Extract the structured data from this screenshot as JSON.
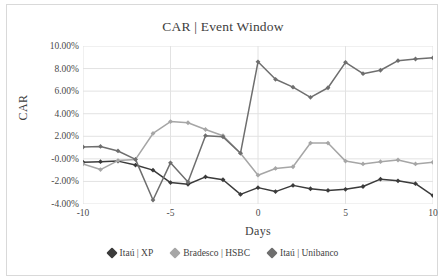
{
  "chart_data": {
    "type": "line",
    "title": "CAR | Event Window",
    "xlabel": "Days",
    "ylabel": "CAR",
    "x": [
      -10,
      -9,
      -8,
      -7,
      -6,
      -5,
      -4,
      -3,
      -2,
      -1,
      0,
      1,
      2,
      3,
      4,
      5,
      6,
      7,
      8,
      9,
      10
    ],
    "xlim": [
      -10,
      10
    ],
    "ylim": [
      -4.0,
      10.0
    ],
    "xticks": [
      -10,
      -5,
      0,
      5,
      10
    ],
    "xtick_labels": [
      "-10",
      "-5",
      "0",
      "5",
      "10"
    ],
    "yticks": [
      10.0,
      8.0,
      6.0,
      4.0,
      2.0,
      0.0,
      -2.0,
      -4.0
    ],
    "ytick_labels": [
      "10.00%",
      "8.00%",
      "6.00%",
      "4.00%",
      "2.00%",
      "-0.00%",
      "-2.00%",
      "-4.00%"
    ],
    "grid": true,
    "legend_position": "bottom",
    "value_unit": "%",
    "series": [
      {
        "name": "Itaú | XP",
        "color": "#3b3b3b",
        "marker": "diamond",
        "values": [
          -0.3,
          -0.25,
          -0.2,
          -0.55,
          -1.0,
          -2.1,
          -2.25,
          -1.6,
          -1.85,
          -3.15,
          -2.55,
          -2.9,
          -2.35,
          -2.65,
          -2.8,
          -2.7,
          -2.45,
          -1.8,
          -1.95,
          -2.2,
          -3.25
        ]
      },
      {
        "name": "Bradesco | HSBC",
        "color": "#a6a6a6",
        "marker": "diamond",
        "values": [
          -0.45,
          -0.95,
          -0.15,
          -0.05,
          2.25,
          3.3,
          3.2,
          2.6,
          2.05,
          0.5,
          -1.45,
          -0.85,
          -0.7,
          1.4,
          1.4,
          -0.2,
          -0.45,
          -0.25,
          -0.1,
          -0.45,
          -0.3
        ]
      },
      {
        "name": "Itaú | Unibanco",
        "color": "#6e6e6e",
        "marker": "diamond",
        "values": [
          1.05,
          1.1,
          0.7,
          -0.05,
          -3.65,
          -0.35,
          -2.05,
          2.05,
          1.95,
          0.5,
          8.6,
          7.05,
          6.35,
          5.45,
          6.3,
          8.55,
          7.55,
          7.85,
          8.7,
          8.85,
          8.95
        ]
      }
    ]
  },
  "legend": {
    "items": [
      {
        "label": "Itaú | XP",
        "color": "#3b3b3b"
      },
      {
        "label": "Bradesco | HSBC",
        "color": "#a6a6a6"
      },
      {
        "label": "Itaú | Unibanco",
        "color": "#6e6e6e"
      }
    ]
  }
}
